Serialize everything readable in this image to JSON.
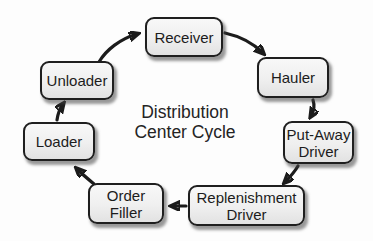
{
  "diagram": {
    "title": "Distribution Center Cycle",
    "title_lines": [
      "Distribution",
      "Center Cycle"
    ],
    "nodes": [
      {
        "id": "receiver",
        "label": "Receiver",
        "lines": [
          "Receiver"
        ]
      },
      {
        "id": "hauler",
        "label": "Hauler",
        "lines": [
          "Hauler"
        ]
      },
      {
        "id": "put-away-driver",
        "label": "Put-Away Driver",
        "lines": [
          "Put-Away",
          "Driver"
        ]
      },
      {
        "id": "replenishment-driver",
        "label": "Replenishment Driver",
        "lines": [
          "Replenishment",
          "Driver"
        ]
      },
      {
        "id": "order-filler",
        "label": "Order Filler",
        "lines": [
          "Order",
          "Filler"
        ]
      },
      {
        "id": "loader",
        "label": "Loader",
        "lines": [
          "Loader"
        ]
      },
      {
        "id": "unloader",
        "label": "Unloader",
        "lines": [
          "Unloader"
        ]
      }
    ],
    "edges": [
      {
        "from": "Receiver",
        "to": "Hauler"
      },
      {
        "from": "Hauler",
        "to": "Put-Away Driver"
      },
      {
        "from": "Put-Away Driver",
        "to": "Replenishment Driver"
      },
      {
        "from": "Replenishment Driver",
        "to": "Order Filler"
      },
      {
        "from": "Order Filler",
        "to": "Loader"
      },
      {
        "from": "Loader",
        "to": "Unloader"
      },
      {
        "from": "Unloader",
        "to": "Receiver"
      }
    ],
    "colors": {
      "background": "#fdfdfd",
      "box_fill_top": "#f8f8f8",
      "box_fill_bottom": "#e2e2e2",
      "box_border": "#1f1f1f",
      "arrow": "#1c1c1c",
      "text": "#1c1c1c"
    }
  }
}
